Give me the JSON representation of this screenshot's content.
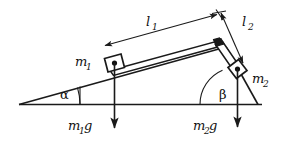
{
  "figure": {
    "background_color": "#ffffff",
    "stroke_color": "#1a1a1a"
  },
  "labels": {
    "length_1": "l",
    "length_1_sub": "1",
    "length_2": "l",
    "length_2_sub": "2",
    "mass_1": "m",
    "mass_1_sub": "1",
    "mass_2": "m",
    "mass_2_sub": "2",
    "angle_1": "α",
    "angle_2": "β",
    "weight_1": "m",
    "weight_1_sub": "1",
    "weight_1_g": "g",
    "weight_2": "m",
    "weight_2_sub": "2",
    "weight_2_g": "g"
  },
  "elements": {
    "rod_1_name": "rod-l1",
    "rod_2_name": "rod-l2",
    "block_1_name": "block-m1",
    "block_2_name": "block-m2",
    "baseline_name": "horizontal-baseline",
    "incline_name": "incline-line",
    "right_edge_name": "right-edge-line",
    "pivot_name": "pivot-joint",
    "dim_1_name": "dimension-line-l1",
    "dim_2_name": "dimension-line-l2",
    "arc_1_name": "angle-arc-alpha",
    "arc_2_name": "angle-arc-beta",
    "force_1_name": "force-vector-m1g",
    "force_2_name": "force-vector-m2g"
  }
}
